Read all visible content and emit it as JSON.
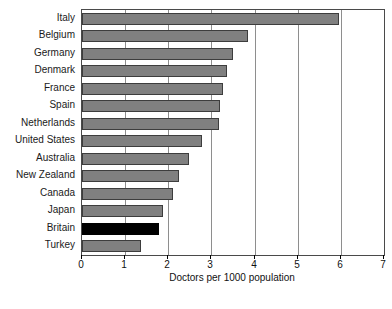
{
  "chart_data": {
    "type": "bar",
    "orientation": "horizontal",
    "title": "",
    "xlabel": "Doctors per 1000 population",
    "ylabel": "",
    "xlim": [
      0,
      7
    ],
    "ylim": null,
    "grid": "vertical gridlines at every integer tick",
    "legend": null,
    "xticks": [
      "0",
      "1",
      "2",
      "3",
      "4",
      "5",
      "6",
      "7"
    ],
    "categories": [
      "Italy",
      "Belgium",
      "Germany",
      "Denmark",
      "France",
      "Spain",
      "Netherlands",
      "United States",
      "Australia",
      "New Zealand",
      "Canada",
      "Japan",
      "Britain",
      "Turkey"
    ],
    "values": [
      5.95,
      3.85,
      3.5,
      3.35,
      3.27,
      3.2,
      3.18,
      2.78,
      2.48,
      2.25,
      2.1,
      1.88,
      1.79,
      1.37
    ],
    "highlight_category": "Britain",
    "colors": {
      "bar": "#808080",
      "bar_edge": "#3d3d3d",
      "highlight_bar": "#000000",
      "gridline": "#8e8e8e",
      "frame": "#4a4a4a",
      "text": "#111111",
      "background": "#ffffff"
    }
  },
  "axis": {
    "x_title": "Doctors per 1000 population",
    "ticks": [
      {
        "value": 0,
        "label": "0"
      },
      {
        "value": 1,
        "label": "1"
      },
      {
        "value": 2,
        "label": "2"
      },
      {
        "value": 3,
        "label": "3"
      },
      {
        "value": 4,
        "label": "4"
      },
      {
        "value": 5,
        "label": "5"
      },
      {
        "value": 6,
        "label": "6"
      },
      {
        "value": 7,
        "label": "7"
      }
    ]
  },
  "footer": {
    "source_note": ""
  }
}
